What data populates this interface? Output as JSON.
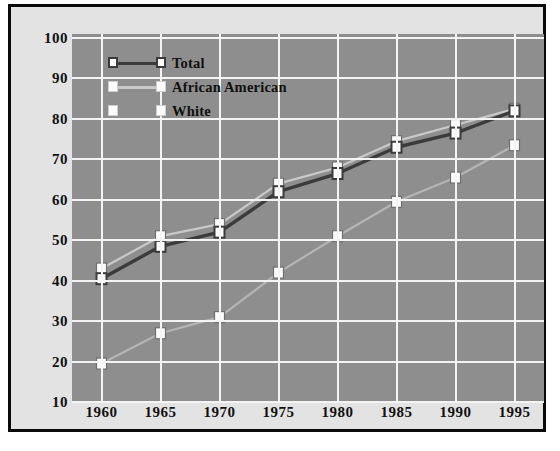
{
  "chart_data": {
    "type": "line",
    "title": "",
    "subtitle": "",
    "xlabel": "",
    "ylabel": "",
    "x": [
      1960,
      1965,
      1970,
      1975,
      1980,
      1985,
      1990,
      1995
    ],
    "xticklabels": [
      "1960",
      "1965",
      "1970",
      "1975",
      "1980",
      "1985",
      "1990",
      "1995"
    ],
    "yticklabels": [
      "10",
      "20",
      "30",
      "40",
      "50",
      "60",
      "70",
      "80",
      "90",
      "100"
    ],
    "yticks": [
      10,
      20,
      30,
      40,
      50,
      60,
      70,
      80,
      90,
      100
    ],
    "xlim": [
      1957.5,
      1997.5
    ],
    "ylim": [
      10,
      101
    ],
    "grid": "both",
    "legend_position": "upper-left-inside",
    "series": [
      {
        "name": "Total",
        "color": "#3b3b3b",
        "marker": "open-square",
        "values": [
          40.5,
          48.5,
          52.0,
          62.0,
          66.5,
          73.0,
          76.5,
          82.0
        ]
      },
      {
        "name": "African American",
        "color": "#c9c9c9",
        "marker": "filled-square",
        "values": [
          43.0,
          51.0,
          54.0,
          64.0,
          68.0,
          74.5,
          78.5,
          82.5
        ]
      },
      {
        "name": "White",
        "color": "#b5b5b5",
        "marker": "filled-square",
        "values": [
          19.5,
          27.0,
          31.0,
          42.0,
          51.0,
          59.5,
          65.5,
          73.5
        ]
      }
    ]
  },
  "legend": {
    "entries": [
      {
        "label": "Total"
      },
      {
        "label": "African American"
      },
      {
        "label": "White"
      }
    ]
  },
  "colors": {
    "plot_background": "#8e8e8e",
    "panel_background": "#e3e3e3",
    "frame_border": "#0a0a0a",
    "gridline": "#f4f4f4",
    "marker_fill": "#fbfbfb",
    "text": "#111111"
  }
}
